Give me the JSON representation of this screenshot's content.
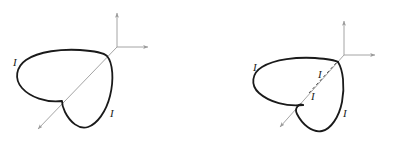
{
  "document": {
    "title": "Current loop figures",
    "background_color": "#ffffff",
    "width": 394,
    "height": 143
  },
  "style": {
    "loop_color": "#1a1a1a",
    "loop_width": 1.8,
    "axis_color": "#9a9a9a",
    "axis_width": 0.9,
    "diagonal_axis_color": "#9a9a9a",
    "dashed_color": "#777777",
    "label_color": "#1a1a1a"
  },
  "figures": [
    {
      "id": "figure-left",
      "name": "single-current-loop",
      "caption": "",
      "axes": {
        "origin": {
          "x": 117,
          "y": 47
        },
        "vertical_tip": {
          "x": 117,
          "y": 10
        },
        "horizontal_tip": {
          "x": 151,
          "y": 47
        },
        "diagonal_tip": {
          "x": 35,
          "y": 132
        }
      },
      "labels": [
        {
          "text": "I",
          "x": 13,
          "y": 66,
          "name": "current-label-left"
        },
        {
          "text": "I",
          "x": 110,
          "y": 117,
          "name": "current-label-lower-right"
        }
      ],
      "loop": {
        "name": "cardioid-loop",
        "cusp": {
          "x": 62,
          "y": 101
        },
        "top_right": {
          "x": 107,
          "y": 55
        },
        "leftmost": {
          "x": 19,
          "y": 79
        },
        "bottom": {
          "x": 88,
          "y": 128
        },
        "dashed_segments": []
      }
    },
    {
      "id": "figure-right",
      "name": "current-loop-with-hidden-segment",
      "caption": "",
      "axes": {
        "origin": {
          "x": 147,
          "y": 55
        },
        "vertical_tip": {
          "x": 147,
          "y": 18
        },
        "horizontal_tip": {
          "x": 181,
          "y": 55
        },
        "diagonal_tip": {
          "x": 80,
          "y": 130
        }
      },
      "labels": [
        {
          "text": "I",
          "x": 56,
          "y": 71,
          "name": "current-label-left"
        },
        {
          "text": "I",
          "x": 121,
          "y": 78,
          "name": "current-label-upper-middle"
        },
        {
          "text": "I",
          "x": 114,
          "y": 100,
          "name": "current-label-lower-middle"
        },
        {
          "text": "I",
          "x": 146,
          "y": 117,
          "name": "current-label-lower-right"
        }
      ],
      "loop": {
        "name": "cardioid-loop",
        "cusp": {
          "x": 106,
          "y": 105
        },
        "top_right": {
          "x": 140,
          "y": 61
        },
        "leftmost": {
          "x": 56,
          "y": 85
        },
        "bottom": {
          "x": 132,
          "y": 131
        },
        "dashed_segments": [
          {
            "from": {
              "x": 112,
              "y": 93
            },
            "to": {
              "x": 140,
              "y": 61
            }
          }
        ]
      }
    }
  ]
}
